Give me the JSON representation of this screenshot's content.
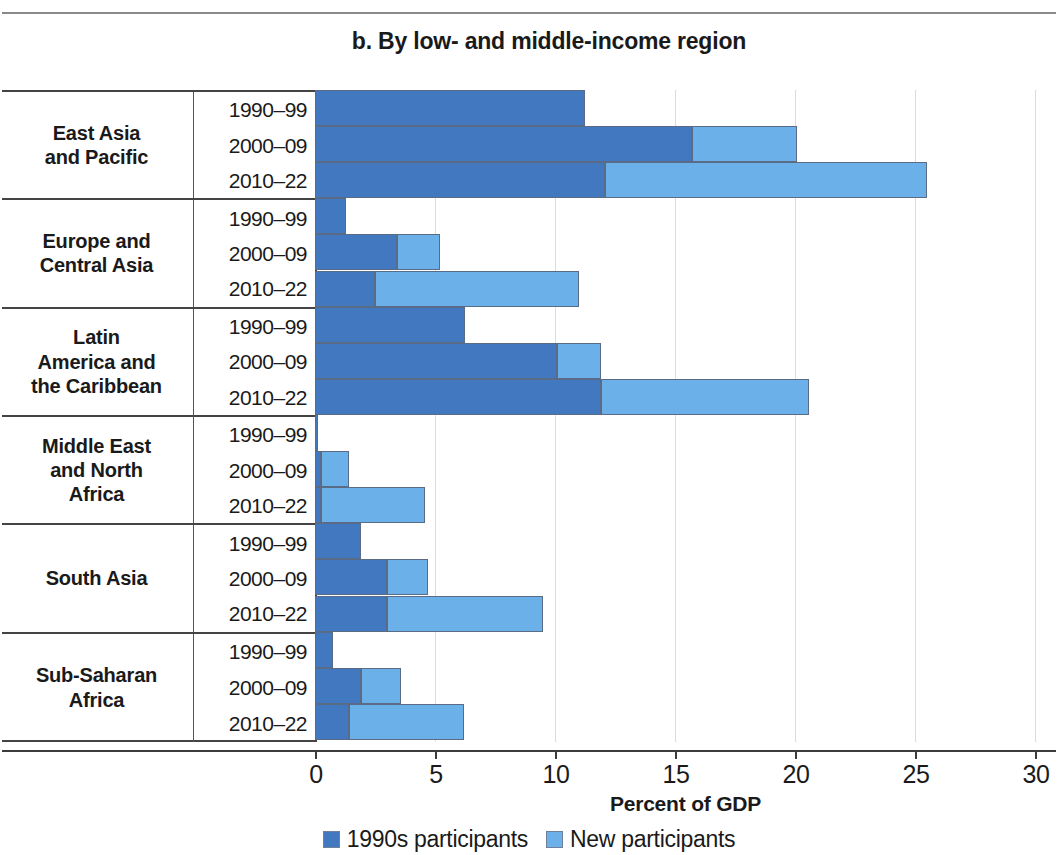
{
  "title": "b. By low- and middle-income region",
  "axis": {
    "x_title": "Percent of GDP",
    "ticks": [
      "0",
      "5",
      "10",
      "15",
      "20",
      "25",
      "30"
    ]
  },
  "legend": [
    {
      "label": "1990s participants",
      "color": "#4178c0",
      "key": "old"
    },
    {
      "label": "New participants",
      "color": "#6cb0ea",
      "key": "new"
    }
  ],
  "chart_data": {
    "type": "bar",
    "orientation": "horizontal",
    "stacked": true,
    "title": "b. By low- and middle-income region",
    "xlabel": "Percent of GDP",
    "ylabel": "",
    "xlim": [
      0,
      30
    ],
    "xticks": [
      0,
      5,
      10,
      15,
      20,
      25,
      30
    ],
    "grid": "vertical",
    "legend_position": "bottom",
    "series": [
      {
        "name": "1990s participants",
        "color": "#4178c0"
      },
      {
        "name": "New participants",
        "color": "#6cb0ea"
      }
    ],
    "groups": [
      {
        "region": "East Asia and Pacific",
        "region_lines": [
          "East Asia",
          "and Pacific"
        ],
        "rows": [
          {
            "period": "1990–99",
            "values": {
              "old": 11.25,
              "new": 0.0
            },
            "total": 11.25
          },
          {
            "period": "2000–09",
            "values": {
              "old": 15.7,
              "new": 4.4
            },
            "total": 20.1
          },
          {
            "period": "2010–22",
            "values": {
              "old": 12.1,
              "new": 13.4
            },
            "total": 25.5
          }
        ]
      },
      {
        "region": "Europe and Central Asia",
        "region_lines": [
          "Europe and",
          "Central Asia"
        ],
        "rows": [
          {
            "period": "1990–99",
            "values": {
              "old": 1.3,
              "new": 0.0
            },
            "total": 1.3
          },
          {
            "period": "2000–09",
            "values": {
              "old": 3.4,
              "new": 1.8
            },
            "total": 5.2
          },
          {
            "period": "2010–22",
            "values": {
              "old": 2.5,
              "new": 8.5
            },
            "total": 11.0
          }
        ]
      },
      {
        "region": "Latin America and the Caribbean",
        "region_lines": [
          "Latin",
          "America and",
          "the Caribbean"
        ],
        "rows": [
          {
            "period": "1990–99",
            "values": {
              "old": 6.25,
              "new": 0.0
            },
            "total": 6.25
          },
          {
            "period": "2000–09",
            "values": {
              "old": 10.1,
              "new": 1.8
            },
            "total": 11.9
          },
          {
            "period": "2010–22",
            "values": {
              "old": 11.9,
              "new": 8.7
            },
            "total": 20.6
          }
        ]
      },
      {
        "region": "Middle East and North Africa",
        "region_lines": [
          "Middle East",
          "and North",
          "Africa"
        ],
        "rows": [
          {
            "period": "1990–99",
            "values": {
              "old": 0.12,
              "new": 0.0
            },
            "total": 0.12
          },
          {
            "period": "2000–09",
            "values": {
              "old": 0.25,
              "new": 1.15
            },
            "total": 1.4
          },
          {
            "period": "2010–22",
            "values": {
              "old": 0.25,
              "new": 4.35
            },
            "total": 4.6
          }
        ]
      },
      {
        "region": "South Asia",
        "region_lines": [
          "South Asia"
        ],
        "rows": [
          {
            "period": "1990–99",
            "values": {
              "old": 1.9,
              "new": 0.0
            },
            "total": 1.9
          },
          {
            "period": "2000–09",
            "values": {
              "old": 3.0,
              "new": 1.7
            },
            "total": 4.7
          },
          {
            "period": "2010–22",
            "values": {
              "old": 3.0,
              "new": 6.5
            },
            "total": 9.5
          }
        ]
      },
      {
        "region": "Sub-Saharan Africa",
        "region_lines": [
          "Sub-Saharan",
          "Africa"
        ],
        "rows": [
          {
            "period": "1990–99",
            "values": {
              "old": 0.75,
              "new": 0.0
            },
            "total": 0.75
          },
          {
            "period": "2000–09",
            "values": {
              "old": 1.9,
              "new": 1.7
            },
            "total": 3.6
          },
          {
            "period": "2010–22",
            "values": {
              "old": 1.4,
              "new": 4.8
            },
            "total": 6.2
          }
        ]
      }
    ]
  }
}
